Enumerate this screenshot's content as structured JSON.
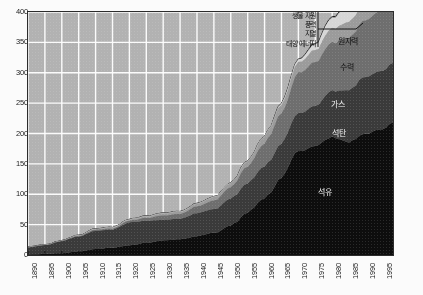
{
  "chart_data": {
    "type": "area",
    "title": "",
    "xlabel": "",
    "ylabel": "",
    "stacked": true,
    "grid": true,
    "legend_position": "in-plot annotations",
    "xlim": [
      1890,
      1998
    ],
    "ylim": [
      0,
      400
    ],
    "ytick_labels": [
      "0",
      "50",
      "100",
      "150",
      "200",
      "250",
      "300",
      "350",
      "400"
    ],
    "ytick_values": [
      0,
      50,
      100,
      150,
      200,
      250,
      300,
      350,
      400
    ],
    "xtick_labels": [
      "1890",
      "1895",
      "1900",
      "1905",
      "1910",
      "1915",
      "1920",
      "1925",
      "1930",
      "1935",
      "1940",
      "1945",
      "1950",
      "1955",
      "1960",
      "1965",
      "1970",
      "1975",
      "1980",
      "1985",
      "1990",
      "1995"
    ],
    "xtick_values": [
      1890,
      1895,
      1900,
      1905,
      1910,
      1915,
      1920,
      1925,
      1930,
      1935,
      1940,
      1945,
      1950,
      1955,
      1960,
      1965,
      1970,
      1975,
      1980,
      1985,
      1990,
      1995
    ],
    "x": [
      1890,
      1895,
      1900,
      1905,
      1910,
      1915,
      1920,
      1925,
      1930,
      1935,
      1940,
      1945,
      1950,
      1955,
      1960,
      1965,
      1970,
      1975,
      1980,
      1985,
      1990,
      1995,
      1998
    ],
    "series": [
      {
        "name": "석유",
        "color": "#0d0d0d",
        "values": [
          1,
          2,
          3,
          6,
          10,
          12,
          16,
          20,
          24,
          26,
          31,
          37,
          48,
          70,
          95,
          125,
          170,
          180,
          194,
          186,
          200,
          208,
          218
        ]
      },
      {
        "name": "석탄",
        "color": "#3a3a3a",
        "values": [
          12,
          15,
          20,
          25,
          30,
          30,
          38,
          36,
          34,
          34,
          38,
          39,
          44,
          48,
          52,
          56,
          62,
          66,
          76,
          86,
          94,
          96,
          98
        ]
      },
      {
        "name": "가스",
        "color": "#6e6e6e",
        "values": [
          0,
          0,
          1,
          1,
          2,
          2,
          3,
          5,
          7,
          8,
          11,
          14,
          19,
          28,
          38,
          50,
          66,
          72,
          80,
          86,
          94,
          100,
          104
        ]
      },
      {
        "name": "수력",
        "color": "#9b9b9b",
        "values": [
          0,
          0,
          0,
          1,
          1,
          2,
          2,
          3,
          4,
          4,
          5,
          6,
          7,
          9,
          11,
          14,
          17,
          20,
          23,
          26,
          29,
          31,
          32
        ]
      },
      {
        "name": "원자력",
        "color": "#d6d6d6",
        "values": [
          0,
          0,
          0,
          0,
          0,
          0,
          0,
          0,
          0,
          0,
          0,
          0,
          0,
          0,
          1,
          2,
          4,
          9,
          17,
          26,
          32,
          34,
          35
        ]
      },
      {
        "name": "생물 자원 / 풍력 / 지열 / 태양 에너지",
        "color": "#f4f4f4",
        "values": [
          0,
          0,
          0,
          0,
          0,
          0,
          0,
          0,
          0,
          0,
          0,
          0,
          0,
          0,
          0,
          1,
          1,
          2,
          2,
          3,
          3,
          4,
          4
        ]
      }
    ],
    "annotations": [
      {
        "name": "oil-label",
        "text": "석유"
      },
      {
        "name": "coal-label",
        "text": "석탄"
      },
      {
        "name": "gas-label",
        "text": "가스"
      },
      {
        "name": "hydro-label",
        "text": "수력"
      },
      {
        "name": "nuclear-label",
        "text": "원자력"
      }
    ]
  },
  "callout": {
    "lines": [
      {
        "label": "생물 자원"
      },
      {
        "label": "풍력"
      },
      {
        "label": "지열"
      },
      {
        "label": "태양 에너지"
      }
    ]
  },
  "labels": {
    "oil": "석유",
    "coal": "석탄",
    "gas": "가스",
    "hydro": "수력",
    "nuclear": "원자력",
    "biomass": "생물 자원",
    "wind": "풍력",
    "geothermal": "지열",
    "solar": "태양 에너지"
  },
  "axis": {
    "y_labels": [
      "400",
      "350",
      "300",
      "250",
      "200",
      "150",
      "100",
      "50",
      "0"
    ],
    "x_labels": [
      "1890",
      "1895",
      "1900",
      "1905",
      "1910",
      "1915",
      "1920",
      "1925",
      "1930",
      "1935",
      "1940",
      "1945",
      "1950",
      "1955",
      "1960",
      "1965",
      "1970",
      "1975",
      "1980",
      "1985",
      "1990",
      "1995"
    ]
  },
  "colors": {
    "plot_background": "#b2b2b2",
    "grid": "#ffffff",
    "frame": "#2c2c2c",
    "oil": "#0d0d0d",
    "coal": "#3a3a3a",
    "gas": "#6e6e6e",
    "hydro": "#9b9b9b",
    "nuclear": "#d6d6d6",
    "renewables": "#f4f4f4",
    "page": "#fbfbfb"
  }
}
